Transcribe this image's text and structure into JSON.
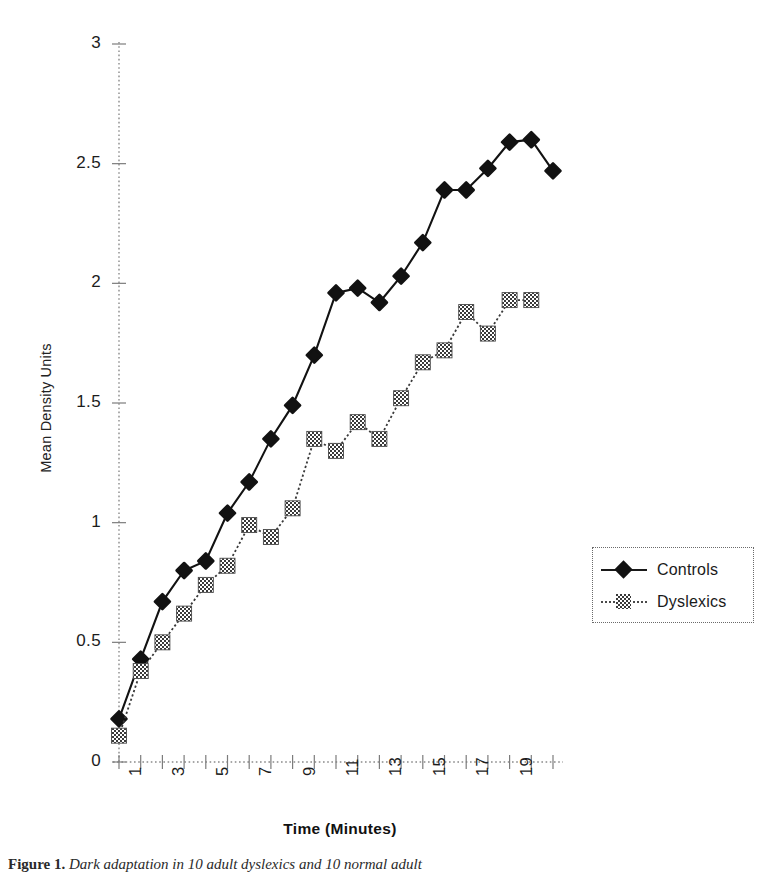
{
  "figure": {
    "caption_lead": "Figure 1.",
    "caption_text": " Dark adaptation in 10 adult dyslexics and 10 normal adult"
  },
  "axes": {
    "y_title": "Mean Density Units",
    "x_title": "Time (Minutes)"
  },
  "legend": {
    "position": "right",
    "items": [
      {
        "label": "Controls",
        "marker": "diamond-filled",
        "line": "solid"
      },
      {
        "label": "Dyslexics",
        "marker": "square-hatched",
        "line": "dotted"
      }
    ]
  },
  "chart_data": {
    "type": "line",
    "title": "",
    "xlabel": "Time (Minutes)",
    "ylabel": "Mean Density Units",
    "xlim": [
      1,
      21
    ],
    "ylim": [
      0,
      3
    ],
    "y_ticks": [
      0,
      0.5,
      1,
      1.5,
      2,
      2.5,
      3
    ],
    "y_tick_labels": [
      "0",
      "0.5",
      "1",
      "1.5",
      "2",
      "2.5",
      "3"
    ],
    "x_ticks": [
      1,
      2,
      3,
      4,
      5,
      6,
      7,
      8,
      9,
      10,
      11,
      12,
      13,
      14,
      15,
      16,
      17,
      18,
      19,
      20,
      21
    ],
    "x_tick_labels": [
      "1",
      "",
      "3",
      "",
      "5",
      "",
      "7",
      "",
      "9",
      "",
      "11",
      "",
      "13",
      "",
      "15",
      "",
      "17",
      "",
      "19",
      "",
      ""
    ],
    "x_tick_label_rotation": -90,
    "grid": false,
    "axis_style": "dotted",
    "x": [
      1,
      2,
      3,
      4,
      5,
      6,
      7,
      8,
      9,
      10,
      11,
      12,
      13,
      14,
      15,
      16,
      17,
      18,
      19,
      20,
      21
    ],
    "series": [
      {
        "name": "Controls",
        "marker": "diamond-filled",
        "line": "solid",
        "color": "#121212",
        "values": [
          0.18,
          0.43,
          0.67,
          0.8,
          0.84,
          1.04,
          1.17,
          1.35,
          1.49,
          1.7,
          1.96,
          1.98,
          1.92,
          2.03,
          2.17,
          2.39,
          2.39,
          2.48,
          2.59,
          2.6,
          2.47
        ]
      },
      {
        "name": "Dyslexics",
        "marker": "square-hatched",
        "line": "dotted",
        "color": "#3a3a3a",
        "values": [
          0.11,
          0.38,
          0.5,
          0.62,
          0.74,
          0.82,
          0.99,
          0.94,
          1.06,
          1.35,
          1.3,
          1.42,
          1.35,
          1.52,
          1.67,
          1.72,
          1.88,
          1.79,
          1.93,
          1.93,
          null
        ]
      }
    ]
  },
  "plot_geometry": {
    "x_origin_px": 119,
    "x_step_px": 21.7,
    "y_zero_px": 762,
    "y_scale_px_per_unit": 239.3
  }
}
